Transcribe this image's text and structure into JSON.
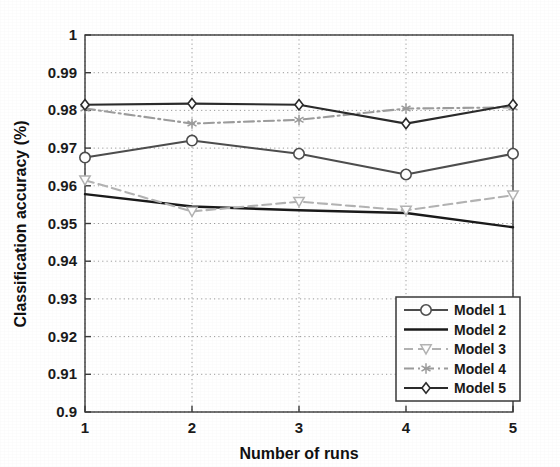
{
  "chart_data": {
    "type": "line",
    "title": "",
    "xlabel": "Number of runs",
    "ylabel": "Classification accuracy (%)",
    "x": [
      1,
      2,
      3,
      4,
      5
    ],
    "xlim": [
      1,
      5
    ],
    "ylim": [
      0.9,
      1
    ],
    "xticks": [
      "1",
      "2",
      "3",
      "4",
      "5"
    ],
    "yticks": [
      "0.9",
      "0.91",
      "0.92",
      "0.93",
      "0.94",
      "0.95",
      "0.96",
      "0.97",
      "0.98",
      "0.99",
      "1"
    ],
    "grid": true,
    "grid_style": "dotted",
    "legend_position": "lower right",
    "series": [
      {
        "name": "Model 1",
        "values": [
          0.9675,
          0.972,
          0.9685,
          0.963,
          0.9685
        ],
        "color": "#4d4d4d",
        "marker": "circle",
        "linestyle": "solid"
      },
      {
        "name": "Model 2",
        "values": [
          0.9578,
          0.9545,
          0.9535,
          0.9528,
          0.949
        ],
        "color": "#1a1a1a",
        "marker": "none",
        "linestyle": "solid"
      },
      {
        "name": "Model 3",
        "values": [
          0.9615,
          0.9532,
          0.9558,
          0.9535,
          0.9575
        ],
        "color": "#b3b3b3",
        "marker": "triangle-down",
        "linestyle": "dashed"
      },
      {
        "name": "Model 4",
        "values": [
          0.9805,
          0.9765,
          0.9775,
          0.9805,
          0.9808
        ],
        "color": "#9c9c9c",
        "marker": "star",
        "linestyle": "dashdot"
      },
      {
        "name": "Model 5",
        "values": [
          0.9815,
          0.9818,
          0.9815,
          0.9765,
          0.9815
        ],
        "color": "#2b2b2b",
        "marker": "diamond",
        "linestyle": "solid"
      }
    ]
  }
}
